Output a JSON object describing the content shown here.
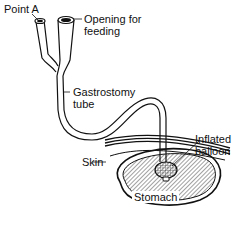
{
  "diagram": {
    "labels": {
      "point_a": "Point A",
      "opening_line1": "Opening for",
      "opening_line2": "feeding",
      "tube_line1": "Gastrostomy",
      "tube_line2": "tube",
      "skin": "Skin",
      "balloon_line1": "Inflated",
      "balloon_line2": "balloon",
      "stomach": "Stomach"
    },
    "colors": {
      "line": "#111111",
      "hatch": "#555555",
      "background": "#ffffff"
    }
  }
}
